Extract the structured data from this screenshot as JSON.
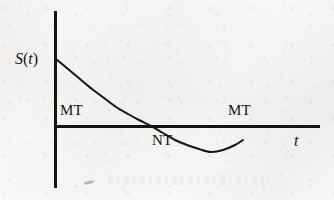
{
  "figure": {
    "background_color": "#f6f5f3",
    "ink_color": "#141414"
  },
  "axes": {
    "y_axis_label": "S(t)",
    "y_axis_label_variable": "S",
    "y_axis_label_open_paren": "(",
    "y_axis_label_argument": "t",
    "y_axis_label_close_paren": ")",
    "x_axis_label": "t",
    "origin": {
      "x": 55,
      "y": 126
    },
    "y_axis_top": 11,
    "y_axis_bottom": 188,
    "x_axis_right": 320,
    "line_width": 3
  },
  "annotations": {
    "left_regime": "MT",
    "middle_regime": "NT",
    "right_regime": "MT"
  },
  "chart_data": {
    "type": "line",
    "title": "",
    "xlabel": "t",
    "ylabel": "S(t)",
    "grid": false,
    "legend": null,
    "xlim": [
      0,
      265
    ],
    "ylim": [
      -26,
      67
    ],
    "zero_line": 0,
    "series": [
      {
        "name": "S(t)",
        "stroke_width": 2,
        "x": [
          1,
          12,
          24,
          36,
          48,
          60,
          72,
          84,
          96,
          108,
          120,
          132,
          144,
          156,
          168,
          180,
          188
        ],
        "y": [
          67,
          56,
          45,
          34,
          24,
          14,
          6,
          0,
          -6,
          -12,
          -18,
          -22,
          -25,
          -26,
          -24,
          -19,
          -12
        ],
        "points_pixel": [
          [
            56,
            59
          ],
          [
            68,
            69
          ],
          [
            80,
            79
          ],
          [
            92,
            89
          ],
          [
            104,
            98
          ],
          [
            116,
            107
          ],
          [
            128,
            114
          ],
          [
            139,
            120
          ],
          [
            151,
            126
          ],
          [
            163,
            133
          ],
          [
            175,
            140
          ],
          [
            187,
            145
          ],
          [
            199,
            149
          ],
          [
            211,
            152
          ],
          [
            223,
            150
          ],
          [
            235,
            145
          ],
          [
            243,
            140
          ]
        ]
      }
    ],
    "x_axis_crossings": [
      115,
      202
    ],
    "minimum_point": {
      "x_pixel": 163,
      "y_pixel": 152
    },
    "curve_start_pixel": {
      "x": 56,
      "y": 59
    },
    "curve_end_pixel": {
      "x": 243,
      "y": 65
    },
    "regions": [
      {
        "label": "MT",
        "description": "curve above axis, decreasing"
      },
      {
        "label": "NT",
        "description": "curve below axis"
      },
      {
        "label": "MT",
        "description": "curve above axis, increasing"
      }
    ]
  }
}
